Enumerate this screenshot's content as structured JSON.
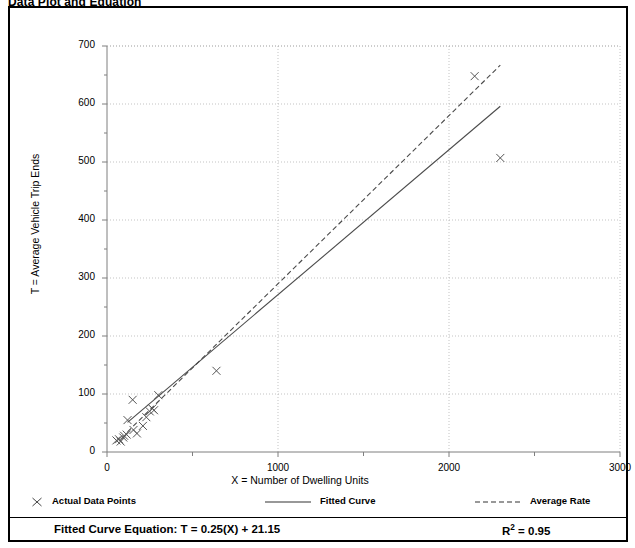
{
  "page": {
    "title": "Data Plot and Equation"
  },
  "chart_data": {
    "type": "scatter",
    "title": "Data Plot and Equation",
    "xlabel": "X = Number of Dwelling Units",
    "ylabel": "T = Average Vehicle Trip Ends",
    "xlim": [
      0,
      3000
    ],
    "ylim": [
      0,
      700
    ],
    "xticks": [
      0,
      1000,
      2000,
      3000
    ],
    "xtick_labels": [
      "0",
      "1000",
      "2000",
      "3000"
    ],
    "xminor_step": 500,
    "yticks": [
      0,
      100,
      200,
      300,
      400,
      500,
      600,
      700
    ],
    "ytick_labels": [
      "0",
      "100",
      "200",
      "300",
      "400",
      "500",
      "600",
      "700"
    ],
    "yminor_step": 50,
    "grid": "dotted-major",
    "legend_position": "below-axes",
    "series": [
      {
        "name": "Actual Data Points",
        "type": "scatter",
        "marker": "x",
        "points": [
          [
            55,
            20
          ],
          [
            70,
            22
          ],
          [
            80,
            18
          ],
          [
            95,
            25
          ],
          [
            100,
            28
          ],
          [
            115,
            30
          ],
          [
            120,
            55
          ],
          [
            150,
            90
          ],
          [
            155,
            38
          ],
          [
            175,
            32
          ],
          [
            210,
            45
          ],
          [
            230,
            60
          ],
          [
            250,
            70
          ],
          [
            265,
            75
          ],
          [
            275,
            72
          ],
          [
            300,
            98
          ],
          [
            640,
            140
          ],
          [
            2150,
            648
          ],
          [
            2300,
            507
          ]
        ]
      },
      {
        "name": "Fitted Curve",
        "type": "line",
        "style": "solid",
        "equation": "T = 0.25(X) + 21.15",
        "slope": 0.25,
        "intercept": 21.15,
        "x_range": [
          120,
          2300
        ]
      },
      {
        "name": "Average Rate",
        "type": "line",
        "style": "dashed",
        "slope": 0.29,
        "intercept": 0,
        "x_range": [
          120,
          2300
        ]
      }
    ],
    "annotations": {
      "equation_label": "Fitted Curve Equation:  T = 0.25(X) + 21.15",
      "r_squared_prefix": "R",
      "r_squared_sup": "2",
      "r_squared_value": " = 0.95"
    }
  },
  "legend": {
    "items": [
      {
        "label": "Actual Data Points",
        "symbol": "x-marker"
      },
      {
        "label": "Fitted Curve",
        "symbol": "solid-line"
      },
      {
        "label": "Average Rate",
        "symbol": "dashed-line"
      }
    ]
  },
  "colors": {
    "ink": "#000000",
    "grid": "#a9a9a9",
    "axis": "#7f7f7f",
    "data": "#555555"
  }
}
